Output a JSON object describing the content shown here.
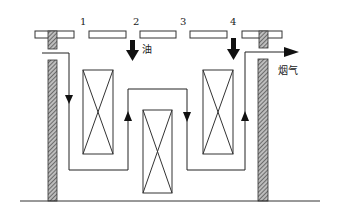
{
  "diagram": {
    "type": "furnace flow schematic",
    "plate_labels": [
      "1",
      "2",
      "3",
      "4"
    ],
    "oil_label": "油",
    "flue_gas_label": "烟气",
    "colors": {
      "line": "#222222",
      "hatch": "#444444",
      "background": "#ffffff"
    },
    "components": [
      {
        "id": "top-plate-left",
        "kind": "plate"
      },
      {
        "id": "top-plate-1",
        "kind": "plate",
        "label": "1"
      },
      {
        "id": "top-plate-2",
        "kind": "plate",
        "label": "2"
      },
      {
        "id": "top-plate-3",
        "kind": "plate",
        "label": "3"
      },
      {
        "id": "top-plate-4",
        "kind": "plate",
        "label": "4"
      },
      {
        "id": "left-wall",
        "kind": "hatched-wall"
      },
      {
        "id": "right-wall",
        "kind": "hatched-wall"
      },
      {
        "id": "box-left",
        "kind": "x-box"
      },
      {
        "id": "box-middle",
        "kind": "x-box"
      },
      {
        "id": "box-right",
        "kind": "x-box"
      },
      {
        "id": "oil-arrow",
        "kind": "down-arrow",
        "label": "油"
      },
      {
        "id": "arrow-4",
        "kind": "down-arrow"
      },
      {
        "id": "flue-gas-arrow",
        "kind": "flow-exit",
        "label": "烟气"
      }
    ]
  }
}
